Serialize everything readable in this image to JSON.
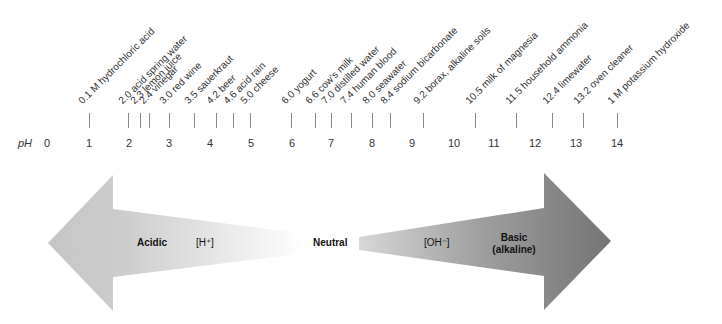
{
  "diagram": {
    "axis": {
      "label": "pH",
      "ticks": [
        "0",
        "1",
        "2",
        "3",
        "4",
        "5",
        "6",
        "7",
        "8",
        "9",
        "10",
        "11",
        "12",
        "13",
        "14"
      ]
    },
    "substances": [
      {
        "ph": 0.1,
        "label": "0.1 M hydrochloric acid",
        "pos": 1.0
      },
      {
        "ph": 2.0,
        "label": "2.0 acid spring water"
      },
      {
        "ph": 2.3,
        "label": "2.3 lemon juice"
      },
      {
        "ph": 2.4,
        "label": "2.4 vinegar"
      },
      {
        "ph": 3.0,
        "label": "3.0 red wine"
      },
      {
        "ph": 3.5,
        "label": "3.5 sauerkraut"
      },
      {
        "ph": 4.2,
        "label": "4.2 beer"
      },
      {
        "ph": 4.6,
        "label": "4.6 acid rain"
      },
      {
        "ph": 5.0,
        "label": "5.0 cheese"
      },
      {
        "ph": 6.0,
        "label": "6.0 yogurt"
      },
      {
        "ph": 6.6,
        "label": "6.6 cow's milk"
      },
      {
        "ph": 7.0,
        "label": "7.0 distilled water"
      },
      {
        "ph": 7.4,
        "label": "7.4 human blood"
      },
      {
        "ph": 8.0,
        "label": "8.0 seawater"
      },
      {
        "ph": 8.4,
        "label": "8.4 sodium bicarbonate"
      },
      {
        "ph": 9.2,
        "label": "9.2 borax, alkaline soils"
      },
      {
        "ph": 10.5,
        "label": "10.5 milk of magnesia"
      },
      {
        "ph": 11.5,
        "label": "11.5 household ammonia"
      },
      {
        "ph": 12.4,
        "label": "12.4 limewater"
      },
      {
        "ph": 13.2,
        "label": "13.2 oven cleaner"
      },
      {
        "ph": 14.0,
        "label": "1 M potassium hydroxide"
      }
    ],
    "arrows": {
      "acidic_label": "Acidic",
      "h_ion_label": "[H⁺]",
      "neutral_label": "Neutral",
      "oh_ion_label": "[OH⁻]",
      "basic_label_line1": "Basic",
      "basic_label_line2": "(alkaline)",
      "acidic_color": "#c8c8c8",
      "basic_color": "#7a7a7a"
    }
  }
}
